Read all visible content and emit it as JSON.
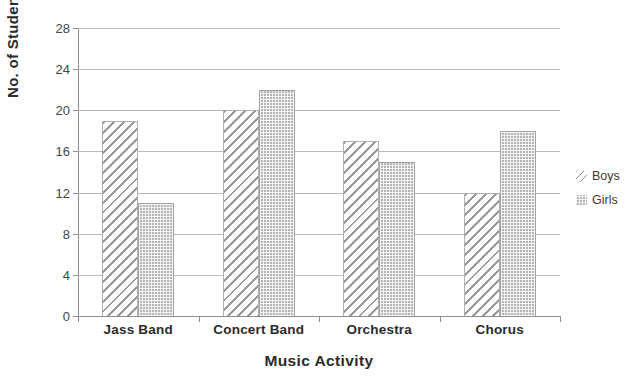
{
  "chart_data": {
    "type": "bar",
    "title": "",
    "xlabel": "Music Activity",
    "ylabel": "No. of Students",
    "categories": [
      "Jass Band",
      "Concert Band",
      "Orchestra",
      "Chorus"
    ],
    "series": [
      {
        "name": "Boys",
        "values": [
          19,
          20,
          17,
          12
        ],
        "pattern": "diagonal-hatch",
        "color": "#9a9a9a"
      },
      {
        "name": "Girls",
        "values": [
          11,
          22,
          15,
          18
        ],
        "pattern": "dotted-fill",
        "color": "#b4b4b4"
      }
    ],
    "ylim": [
      0,
      28
    ],
    "yticks": [
      0,
      4,
      8,
      12,
      16,
      20,
      24,
      28
    ],
    "ytick_labels": [
      "0",
      "4",
      "8",
      "12",
      "16",
      "20",
      "24",
      "28"
    ],
    "grid": "horizontal",
    "legend_position": "right"
  }
}
